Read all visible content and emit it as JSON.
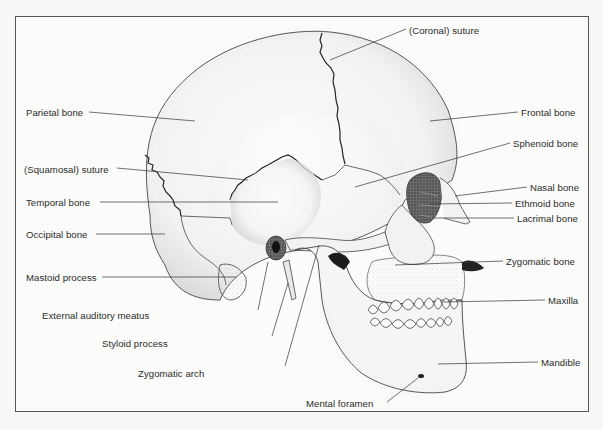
{
  "diagram": {
    "labels": [
      {
        "id": "coronal-suture",
        "text": "(Coronal) suture",
        "x": 409,
        "y": 25,
        "anchor": "left",
        "target": [
          330,
          52
        ]
      },
      {
        "id": "parietal-bone",
        "text": "Parietal bone",
        "x": 26,
        "y": 107,
        "anchor": "left",
        "target": [
          195,
          120
        ]
      },
      {
        "id": "frontal-bone",
        "text": "Frontal bone",
        "x": 521,
        "y": 107,
        "anchor": "right",
        "target": [
          430,
          120
        ]
      },
      {
        "id": "sphenoid-bone",
        "text": "Sphenoid bone",
        "x": 513,
        "y": 138,
        "anchor": "right",
        "target": [
          355,
          185
        ]
      },
      {
        "id": "squamosal-suture",
        "text": "(Squamosal) suture",
        "x": 24,
        "y": 164,
        "anchor": "left",
        "target": [
          248,
          180
        ]
      },
      {
        "id": "temporal-bone",
        "text": "Temporal bone",
        "x": 26,
        "y": 198,
        "anchor": "left",
        "target": [
          278,
          202
        ]
      },
      {
        "id": "nasal-bone",
        "text": "Nasal bone",
        "x": 530,
        "y": 183,
        "anchor": "right",
        "target": [
          455,
          196
        ]
      },
      {
        "id": "ethmoid-bone",
        "text": "Ethmoid bone",
        "x": 515,
        "y": 198,
        "anchor": "right",
        "target": [
          430,
          203
        ]
      },
      {
        "id": "lacrimal-bone",
        "text": "Lacrimal bone",
        "x": 517,
        "y": 213,
        "anchor": "right",
        "target": [
          432,
          218
        ]
      },
      {
        "id": "occipital-bone",
        "text": "Occipital bone",
        "x": 26,
        "y": 229,
        "anchor": "left",
        "target": [
          165,
          233
        ]
      },
      {
        "id": "zygomatic-bone",
        "text": "Zygomatic bone",
        "x": 506,
        "y": 256,
        "anchor": "right",
        "target": [
          395,
          264
        ]
      },
      {
        "id": "mastoid-process",
        "text": "Mastoid process",
        "x": 26,
        "y": 272,
        "anchor": "left",
        "target": [
          236,
          277
        ]
      },
      {
        "id": "maxilla",
        "text": "Maxilla",
        "x": 548,
        "y": 296,
        "anchor": "right",
        "target": [
          444,
          302
        ]
      },
      {
        "id": "external-auditory-meatus",
        "text": "External auditory meatus",
        "x": 42,
        "y": 310,
        "anchor": "left",
        "target": [
          272,
          255
        ]
      },
      {
        "id": "styloid-process",
        "text": "Styloid process",
        "x": 102,
        "y": 338,
        "anchor": "left",
        "target": [
          288,
          282
        ]
      },
      {
        "id": "mandible",
        "text": "Mandible",
        "x": 541,
        "y": 357,
        "anchor": "right",
        "target": [
          438,
          363
        ]
      },
      {
        "id": "zygomatic-arch",
        "text": "Zygomatic arch",
        "x": 138,
        "y": 368,
        "anchor": "left",
        "target": [
          319,
          243
        ]
      },
      {
        "id": "mental-foramen",
        "text": "Mental foramen",
        "x": 206,
        "y": 400,
        "anchor": "left",
        "target": [
          420,
          377
        ]
      }
    ]
  }
}
